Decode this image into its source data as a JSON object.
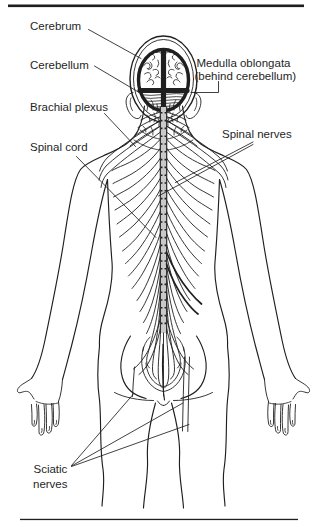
{
  "diagram": {
    "labels": {
      "cerebrum": "Cerebrum",
      "cerebellum": "Cerebellum",
      "medulla_line1": "Medulla oblongata",
      "medulla_line2": "(behind cerebellum)",
      "brachial_plexus": "Brachial plexus",
      "spinal_cord": "Spinal cord",
      "spinal_nerves": "Spinal nerves",
      "sciatic_line1": "Sciatic",
      "sciatic_line2": "nerves"
    },
    "colors": {
      "ink": "#1f1f1f",
      "spinal_cord_fill": "#c9c9c9",
      "background": "#ffffff"
    }
  }
}
